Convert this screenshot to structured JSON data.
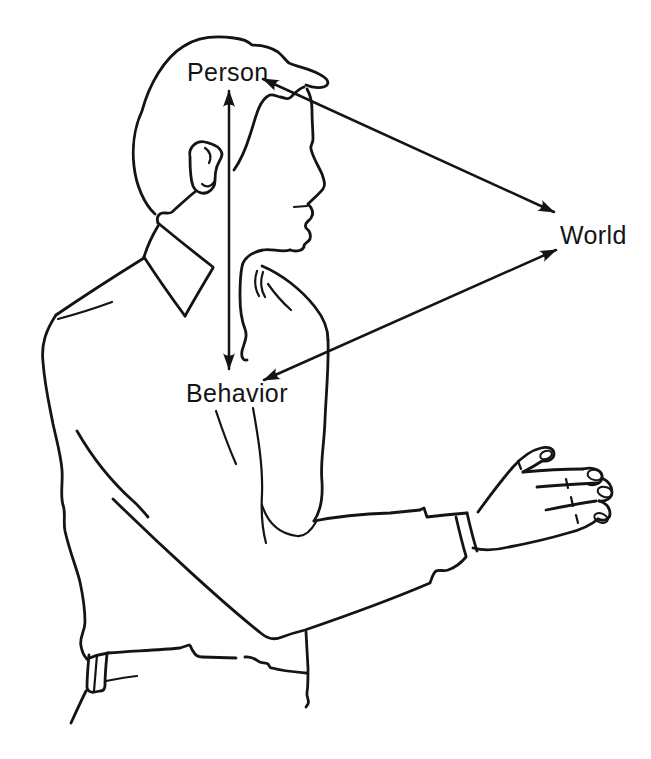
{
  "diagram": {
    "nodes": [
      {
        "id": "person",
        "label": "Person"
      },
      {
        "id": "world",
        "label": "World"
      },
      {
        "id": "behavior",
        "label": "Behavior"
      }
    ],
    "edges": [
      {
        "from": "person",
        "to": "behavior",
        "style": "double-headed-arrow"
      },
      {
        "from": "person",
        "to": "world",
        "style": "double-headed-arrow"
      },
      {
        "from": "behavior",
        "to": "world",
        "style": "double-headed-arrow"
      }
    ]
  },
  "illustration": {
    "subject": "line drawing of a man in profile, collared shirt, arm extended with open hand"
  },
  "colors": {
    "ink": "#141414",
    "paper": "#ffffff"
  }
}
